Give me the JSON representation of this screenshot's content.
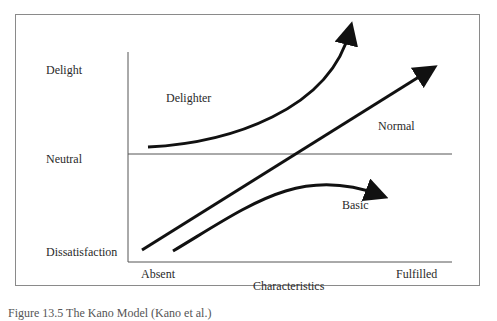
{
  "diagram": {
    "y_axis_labels": {
      "top": "Delight",
      "middle": "Neutral",
      "bottom": "Dissatisfaction"
    },
    "x_axis_labels": {
      "left": "Absent",
      "right": "Fulfilled",
      "title": "Characteristics"
    },
    "curves": [
      {
        "name": "Delighter",
        "label": "Delighter",
        "shape": "exponential-up"
      },
      {
        "name": "Normal",
        "label": "Normal",
        "shape": "linear"
      },
      {
        "name": "Basic",
        "label": "Basic",
        "shape": "rise-then-saturate"
      }
    ],
    "caption": "Figure 13.5 The Kano Model (Kano et al.)"
  }
}
